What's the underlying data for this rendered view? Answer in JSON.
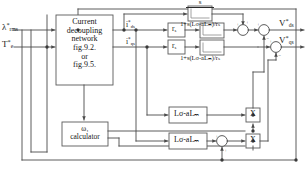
{
  "diagram": {
    "inputs": [
      {
        "name": "flux-reference",
        "symbol": "λ",
        "superscript": "*",
        "subscript": "rms"
      },
      {
        "name": "torque-reference",
        "symbol": "T",
        "superscript": "*",
        "subscript": "e"
      }
    ],
    "decoupling_block": {
      "lines": [
        "Current",
        "decoupling",
        "network",
        "fig.9.2.",
        "or",
        "fig.9.5."
      ]
    },
    "omega_block": {
      "lines": [
        "ω₁",
        "calculator"
      ]
    },
    "current_outputs": [
      {
        "name": "d-axis-current-reference",
        "symbol": "i",
        "superscript": "*",
        "subscript": "ds"
      },
      {
        "name": "q-axis-current-reference",
        "symbol": "i",
        "superscript": "*",
        "subscript": "qs"
      }
    ],
    "gain_blocks": [
      {
        "name": "stator-resistance-d",
        "label": "r",
        "subscript": "s"
      },
      {
        "name": "stator-resistance-q",
        "label": "r",
        "subscript": "s"
      }
    ],
    "transfer_functions": [
      {
        "name": "lead-compensator-top",
        "numerator": "s",
        "denominator": "1+s(Lσ-aLₘ)/rₛ"
      },
      {
        "name": "lead-compensator-d",
        "numerator": "s",
        "denominator": "1+s(Lσ-aLₘ)/rₛ"
      },
      {
        "name": "lead-compensator-q",
        "numerator": "s",
        "denominator": "1+s(Lσ-aLₘ)/rₛ"
      }
    ],
    "inductance_blocks": [
      {
        "name": "leakage-inductance-upper",
        "label": "Lσ-aLₘ"
      },
      {
        "name": "leakage-inductance-lower",
        "label": "Lσ-aLₘ"
      }
    ],
    "multipliers": [
      {
        "name": "multiplier-upper",
        "label": "X"
      },
      {
        "name": "multiplier-lower",
        "label": "X"
      }
    ],
    "voltage_outputs": [
      {
        "name": "d-axis-voltage-reference",
        "symbol": "V",
        "superscript": "*",
        "subscript": "ds"
      },
      {
        "name": "q-axis-voltage-reference",
        "symbol": "V",
        "superscript": "*",
        "subscript": "qs"
      }
    ],
    "summing_signs": [
      "+",
      "+",
      "-",
      "+",
      "+",
      "-"
    ],
    "colors": {
      "line": "#4a4a4a",
      "block_border": "#5a5a5a",
      "text": "#151515",
      "background": "#ffffff"
    }
  }
}
